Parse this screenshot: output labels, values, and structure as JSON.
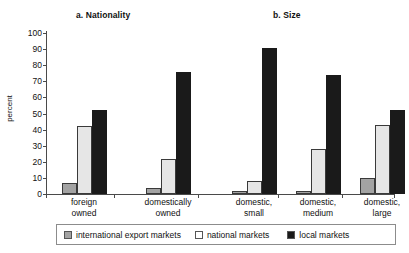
{
  "chart_data": {
    "type": "bar",
    "title": "",
    "panels": [
      {
        "id": "a",
        "title": "a. Nationality",
        "categories": [
          "foreign\nowned",
          "domestically\nowned"
        ],
        "series": [
          {
            "name": "international export markets",
            "values": [
              7,
              4
            ],
            "color": "#a3a3a3"
          },
          {
            "name": "national markets",
            "values": [
              42,
              22
            ],
            "color": "#e6e6e6"
          },
          {
            "name": "local markets",
            "values": [
              52,
              76
            ],
            "color": "#1a1a1a"
          }
        ]
      },
      {
        "id": "b",
        "title": "b. Size",
        "categories": [
          "domestic,\nsmall",
          "domestic,\nmedium",
          "domestic,\nlarge"
        ],
        "series": [
          {
            "name": "international export markets",
            "values": [
              2,
              2,
              10
            ],
            "color": "#a3a3a3"
          },
          {
            "name": "national markets",
            "values": [
              8,
              28,
              43
            ],
            "color": "#e6e6e6"
          },
          {
            "name": "local markets",
            "values": [
              91,
              74,
              52
            ],
            "color": "#1a1a1a"
          }
        ]
      }
    ],
    "xlabel": "",
    "ylabel": "percent",
    "ylim": [
      0,
      100
    ],
    "yticks": [
      0,
      10,
      20,
      30,
      40,
      50,
      60,
      70,
      80,
      90,
      100
    ],
    "ytick_labels": [
      "0",
      "10",
      "20",
      "30",
      "40",
      "50",
      "60",
      "70",
      "80",
      "90",
      "100"
    ],
    "grid": false,
    "legend": {
      "position": "bottom",
      "entries": [
        {
          "label": "international export markets",
          "color": "#a3a3a3"
        },
        {
          "label": "national markets",
          "color": "#e6e6e6"
        },
        {
          "label": "local markets",
          "color": "#1a1a1a"
        }
      ]
    }
  }
}
